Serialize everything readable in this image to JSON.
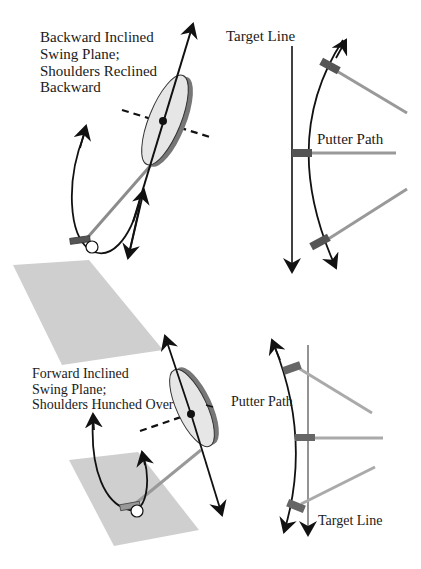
{
  "top_panel": {
    "side_view": {
      "caption_lines": [
        "Backward Inclined",
        "Swing Plane;",
        "Shoulders Reclined",
        "Backward"
      ]
    },
    "overhead_view": {
      "target_line_label": "Target Line",
      "putter_path_label": "Putter Path"
    }
  },
  "bottom_panel": {
    "side_view": {
      "caption_lines": [
        "Forward Inclined",
        "Swing Plane;",
        "Shoulders Hunched Over"
      ]
    },
    "overhead_view": {
      "putter_path_label": "Putter Path",
      "target_line_label": "Target Line"
    }
  },
  "colors": {
    "ground": "#cfcfcf",
    "disc_face": "#e6e6e6",
    "disc_edge": "#777777",
    "shaft": "#8c8c8c",
    "shaft_light": "#a8a8a8",
    "putter_head": "#555555",
    "ink": "#111111"
  }
}
